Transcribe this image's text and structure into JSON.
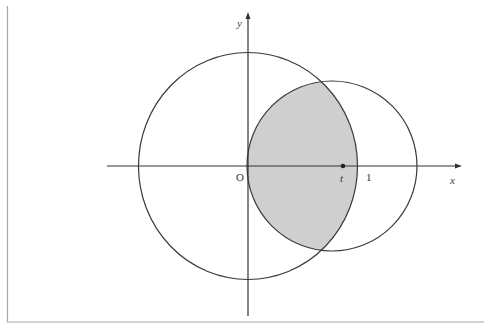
{
  "header": {
    "cropped_text": "··· ··  ·  ··· ·· ··· · ··  · ·· · ·· ··· ·· ···"
  },
  "diagram": {
    "type": "geometry",
    "axes": {
      "x_label": "x",
      "y_label": "y",
      "origin_label": "O"
    },
    "points": [
      {
        "label": "t",
        "description": "center of small circle on x-axis"
      },
      {
        "label": "1",
        "description": "radius of large circle on x-axis"
      }
    ],
    "shapes": [
      {
        "name": "large-circle",
        "description": "circle centered at origin with radius 1"
      },
      {
        "name": "small-circle",
        "description": "circle centered on x-axis passing through origin"
      },
      {
        "name": "shaded-region",
        "description": "intersection of the two circles",
        "fill": "#cfcfcf"
      }
    ],
    "colors": {
      "line": "#333333",
      "shade": "#cfcfcf",
      "border": "#9a9a9a"
    }
  }
}
